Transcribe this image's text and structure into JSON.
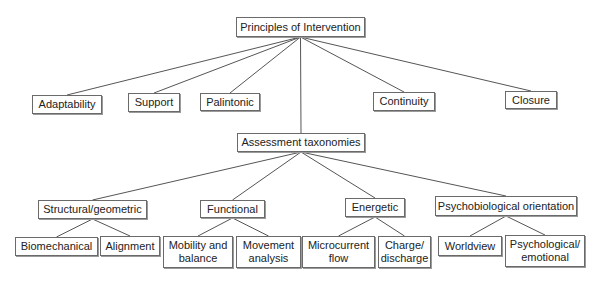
{
  "diagram": {
    "type": "hierarchy",
    "root": {
      "id": "principles",
      "label": "Principles of Intervention"
    },
    "principles": [
      {
        "id": "adaptability",
        "label": "Adaptability"
      },
      {
        "id": "support",
        "label": "Support"
      },
      {
        "id": "palintonic",
        "label": "Palintonic"
      },
      {
        "id": "continuity",
        "label": "Continuity"
      },
      {
        "id": "closure",
        "label": "Closure"
      }
    ],
    "assessment": {
      "id": "assessment",
      "label": "Assessment taxonomies"
    },
    "taxonomies": [
      {
        "id": "structural",
        "label": "Structural/geometric"
      },
      {
        "id": "functional",
        "label": "Functional"
      },
      {
        "id": "energetic",
        "label": "Energetic"
      },
      {
        "id": "psychobiological",
        "label": "Psychobiological orientation"
      }
    ],
    "leaves": [
      {
        "id": "biomechanical",
        "label": "Biomechanical",
        "parent": "structural"
      },
      {
        "id": "alignment",
        "label": "Alignment",
        "parent": "structural"
      },
      {
        "id": "mobility",
        "label": "Mobility and\nbalance",
        "parent": "functional"
      },
      {
        "id": "movement",
        "label": "Movement\nanalysis",
        "parent": "functional"
      },
      {
        "id": "microcurrent",
        "label": "Microcurrent\nflow",
        "parent": "energetic"
      },
      {
        "id": "charge",
        "label": "Charge/\ndischarge",
        "parent": "energetic"
      },
      {
        "id": "worldview",
        "label": "Worldview",
        "parent": "psychobiological"
      },
      {
        "id": "psychological",
        "label": "Psychological/\nemotional",
        "parent": "psychobiological"
      }
    ],
    "edges": [
      [
        "principles",
        "adaptability"
      ],
      [
        "principles",
        "support"
      ],
      [
        "principles",
        "palintonic"
      ],
      [
        "principles",
        "continuity"
      ],
      [
        "principles",
        "closure"
      ],
      [
        "principles",
        "assessment"
      ],
      [
        "assessment",
        "structural"
      ],
      [
        "assessment",
        "functional"
      ],
      [
        "assessment",
        "energetic"
      ],
      [
        "assessment",
        "psychobiological"
      ],
      [
        "structural",
        "biomechanical"
      ],
      [
        "structural",
        "alignment"
      ],
      [
        "functional",
        "mobility"
      ],
      [
        "functional",
        "movement"
      ],
      [
        "energetic",
        "microcurrent"
      ],
      [
        "energetic",
        "charge"
      ],
      [
        "psychobiological",
        "worldview"
      ],
      [
        "psychobiological",
        "psychological"
      ]
    ]
  }
}
